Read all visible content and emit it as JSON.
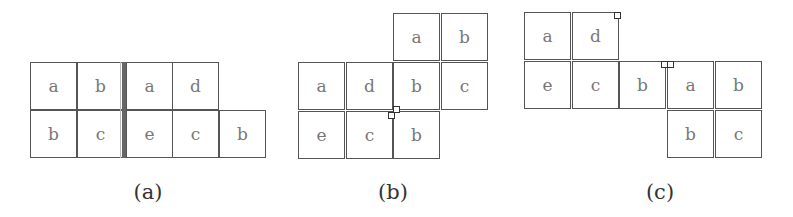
{
  "figure": {
    "panels": [
      {
        "caption": "(a)",
        "cells": [
          {
            "label": "a",
            "x": 30,
            "y": 62
          },
          {
            "label": "b",
            "x": 77,
            "y": 62
          },
          {
            "label": "a",
            "x": 126,
            "y": 62
          },
          {
            "label": "d",
            "x": 172,
            "y": 62
          },
          {
            "label": "b",
            "x": 30,
            "y": 110
          },
          {
            "label": "c",
            "x": 77,
            "y": 110
          },
          {
            "label": "e",
            "x": 126,
            "y": 110
          },
          {
            "label": "c",
            "x": 172,
            "y": 110
          },
          {
            "label": "b",
            "x": 219,
            "y": 110
          }
        ]
      },
      {
        "caption": "(b)",
        "cells": [
          {
            "label": "a",
            "x": 393,
            "y": 13
          },
          {
            "label": "b",
            "x": 441,
            "y": 13
          },
          {
            "label": "a",
            "x": 298,
            "y": 62
          },
          {
            "label": "d",
            "x": 346,
            "y": 62
          },
          {
            "label": "b",
            "x": 393,
            "y": 62
          },
          {
            "label": "c",
            "x": 441,
            "y": 62
          },
          {
            "label": "e",
            "x": 298,
            "y": 111
          },
          {
            "label": "c",
            "x": 346,
            "y": 111
          },
          {
            "label": "b",
            "x": 393,
            "y": 111
          }
        ]
      },
      {
        "caption": "(c)",
        "cells": [
          {
            "label": "a",
            "x": 524,
            "y": 12
          },
          {
            "label": "d",
            "x": 572,
            "y": 12
          },
          {
            "label": "e",
            "x": 524,
            "y": 61
          },
          {
            "label": "c",
            "x": 572,
            "y": 61
          },
          {
            "label": "b",
            "x": 619,
            "y": 61
          },
          {
            "label": "a",
            "x": 667,
            "y": 61
          },
          {
            "label": "b",
            "x": 715,
            "y": 61
          },
          {
            "label": "b",
            "x": 667,
            "y": 110
          },
          {
            "label": "c",
            "x": 715,
            "y": 110
          }
        ]
      }
    ]
  }
}
